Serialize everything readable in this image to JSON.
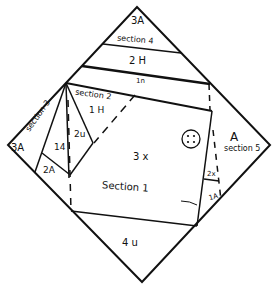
{
  "diagram": {
    "line_color": "#111111",
    "background": "#ffffff"
  },
  "labels": {
    "top_3A": "3A",
    "section4": "section 4",
    "two_H": "2 H",
    "one_n": "1n",
    "section2": "section 2",
    "one_H": "1 H",
    "two_u": "2u",
    "section3": "section 3",
    "left_3A": "3A",
    "one_4": "14",
    "two_A": "2A",
    "three_x": "3 x",
    "section1": "Section 1",
    "right_A": "A",
    "section5": "section 5",
    "two_x": "2x",
    "one_A": "1A",
    "four_u": "4 u"
  }
}
